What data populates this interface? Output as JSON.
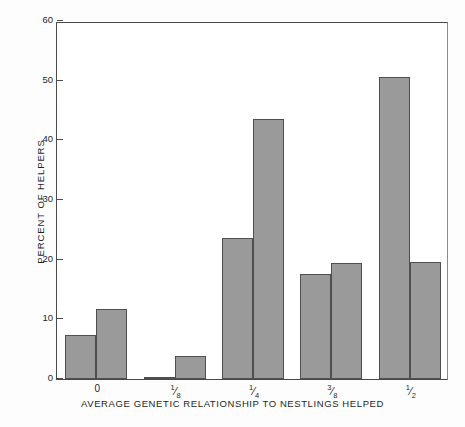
{
  "chart_data": {
    "type": "bar",
    "title": "",
    "subtitle": "",
    "xlabel": "AVERAGE GENETIC RELATIONSHIP TO NESTLINGS HELPED",
    "ylabel": "PERCENT OF HELPERS",
    "categories": [
      "0",
      "1/8",
      "1/4",
      "3/8",
      "1/2"
    ],
    "category_labels_display": [
      {
        "whole": "0",
        "num": "",
        "den": ""
      },
      {
        "whole": "",
        "num": "1",
        "den": "8"
      },
      {
        "whole": "",
        "num": "1",
        "den": "4"
      },
      {
        "whole": "",
        "num": "3",
        "den": "8"
      },
      {
        "whole": "",
        "num": "1",
        "den": "2"
      }
    ],
    "series": [
      {
        "name": "series-1",
        "values": [
          7.4,
          0.2,
          23.6,
          17.6,
          50.6
        ]
      },
      {
        "name": "series-2",
        "values": [
          11.8,
          3.8,
          43.5,
          19.4,
          19.6
        ]
      }
    ],
    "ylim": [
      0,
      60
    ],
    "yticks": [
      0,
      10,
      20,
      30,
      40,
      50,
      60
    ],
    "ytick_labels": [
      "0",
      "10",
      "20",
      "30",
      "40",
      "50",
      "60"
    ],
    "grid": false,
    "legend": "none",
    "bar_fill_color": "#9a9a9a",
    "bar_edge_color": "#4f4f4f",
    "axis_color": "#4a4a4a",
    "background_color": "#ffffff"
  }
}
